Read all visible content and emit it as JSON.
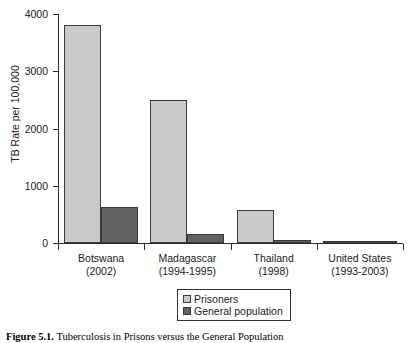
{
  "chart_data": {
    "type": "bar",
    "title": "",
    "xlabel": "",
    "ylabel": "TB Rate per 100,000",
    "ylim": [
      0,
      4000
    ],
    "ytick_labels": [
      "0",
      "1000",
      "2000",
      "3000",
      "4000"
    ],
    "ytick_values": [
      0,
      1000,
      2000,
      3000,
      4000
    ],
    "grid": false,
    "legend_position": "bottom-center",
    "categories": [
      "Botswana (2002)",
      "Madagascar (1994-1995)",
      "Thailand (1998)",
      "United States (1993-2003)"
    ],
    "category_parts": [
      {
        "name": "Botswana",
        "period": "(2002)"
      },
      {
        "name": "Madagascar",
        "period": "(1994-1995)"
      },
      {
        "name": "Thailand",
        "period": "(1998)"
      },
      {
        "name": "United States",
        "period": "(1993-2003)"
      }
    ],
    "series": [
      {
        "name": "Prisoners",
        "color": "#c9c9c9",
        "values": [
          3800,
          2500,
          570,
          25
        ]
      },
      {
        "name": "General population",
        "color": "#636363",
        "values": [
          630,
          160,
          60,
          5
        ]
      }
    ]
  },
  "legend": {
    "items": [
      {
        "label": "Prisoners",
        "color": "#c9c9c9"
      },
      {
        "label": "General population",
        "color": "#636363"
      }
    ]
  },
  "caption": {
    "label": "Figure 5.1.",
    "text": "Tuberculosis in Prisons versus the General Population"
  },
  "colors": {
    "prisoners": "#c9c9c9",
    "general_population": "#636363",
    "axis": "#2b2b2b",
    "bar_border": "#3a3a3a",
    "background": "#ffffff"
  }
}
